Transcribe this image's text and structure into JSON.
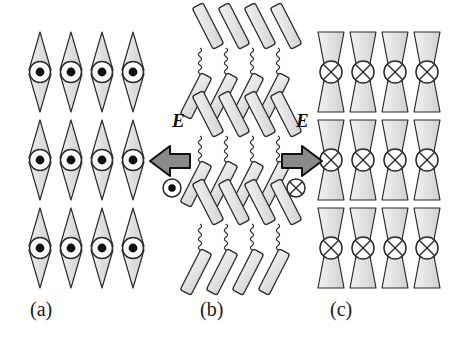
{
  "figure": {
    "type": "diagram",
    "background_color": "#ffffff",
    "width": 452,
    "height": 348
  },
  "style": {
    "shape_fill": "#e2e2e2",
    "shape_fill_light": "#eeeeee",
    "shape_stroke": "#2b2b2b",
    "arrow_fill": "#8a8a8a",
    "arrow_stroke": "#111111",
    "circle_fill": "#ffffff",
    "dot_fill": "#111111",
    "caption_color": "#1a1a1a"
  },
  "panels": [
    {
      "id": "a",
      "caption": "(a)",
      "caption_x": 30,
      "caption_y": 300,
      "unit_shape": "double-cone",
      "unit_symbol": "circle-dot",
      "symbol_meaning": "field-out-of-page",
      "columns": 4,
      "rows": 3,
      "column_x": [
        40,
        71,
        102,
        133
      ],
      "row_y": [
        72,
        160,
        248
      ]
    },
    {
      "id": "b",
      "caption": "(b)",
      "caption_x": 200,
      "caption_y": 300,
      "unit_shape": "tilted-rod",
      "unit_symbol": "none",
      "symbol_meaning": "zigzag-chevron-layers",
      "columns": 4,
      "rows": 3,
      "column_x": [
        202,
        228,
        254,
        280
      ],
      "row_y": [
        72,
        160,
        248
      ],
      "tilt_upper_deg": -27,
      "tilt_lower_deg": 27,
      "connector": "wavy"
    },
    {
      "id": "c",
      "caption": "(c)",
      "caption_x": 330,
      "caption_y": 300,
      "unit_shape": "trapezoid-bowtie",
      "unit_symbol": "circle-cross",
      "symbol_meaning": "field-into-page",
      "columns": 4,
      "rows": 3,
      "column_x": [
        331,
        363,
        395,
        427
      ],
      "row_y": [
        72,
        160,
        248
      ]
    }
  ],
  "field_arrows": [
    {
      "id": "left",
      "label": "E",
      "label_x": 172,
      "label_y": 122,
      "direction": "left",
      "arrow_x": 150,
      "arrow_y": 146,
      "symbol": "circle-dot",
      "symbol_meaning": "field-out-of-page",
      "symbol_x": 172,
      "symbol_y": 188
    },
    {
      "id": "right",
      "label": "E",
      "label_x": 296,
      "label_y": 122,
      "direction": "right",
      "arrow_x": 282,
      "arrow_y": 146,
      "symbol": "circle-cross",
      "symbol_meaning": "field-into-page",
      "symbol_x": 296,
      "symbol_y": 188
    }
  ]
}
